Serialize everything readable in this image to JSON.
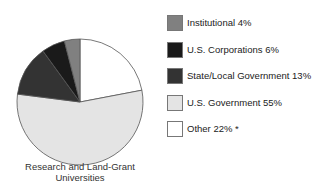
{
  "chart_data": {
    "type": "pie",
    "title": "Research and Land-Grant Universities",
    "start_angle": "12 o'clock",
    "direction": "clockwise",
    "slices": [
      {
        "label": "Other 22% *",
        "name": "Other",
        "value": 22,
        "color": "#ffffff"
      },
      {
        "label": "U.S. Government 55%",
        "name": "U.S. Government",
        "value": 55,
        "color": "#e4e4e4"
      },
      {
        "label": "State/Local Government 13%",
        "name": "State/Local Government",
        "value": 13,
        "color": "#333333"
      },
      {
        "label": "U.S. Corporations 6%",
        "name": "U.S. Corporations",
        "value": 6,
        "color": "#1a1a1a"
      },
      {
        "label": "Institutional 4%",
        "name": "Institutional",
        "value": 4,
        "color": "#808080"
      }
    ],
    "legend": [
      {
        "label": "Institutional 4%",
        "color": "#808080"
      },
      {
        "label": "U.S. Corporations 6%",
        "color": "#1a1a1a"
      },
      {
        "label": "State/Local Government 13%",
        "color": "#333333"
      },
      {
        "label": "U.S. Government 55%",
        "color": "#e4e4e4"
      },
      {
        "label": "Other 22% *",
        "color": "#ffffff"
      }
    ],
    "legend_position": "right"
  },
  "caption": {
    "line1": "Research and Land-Grant",
    "line2": "Universities"
  }
}
